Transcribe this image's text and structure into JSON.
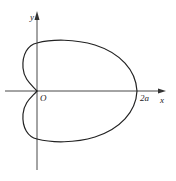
{
  "diagram": {
    "type": "cardioid",
    "equation_hint": "r = a(1 + cos θ)",
    "axes": {
      "x_label": "x",
      "y_label": "y",
      "origin_label": "O",
      "x_tick_label": "2a"
    },
    "colors": {
      "curve": "#222222",
      "axes": "#333333",
      "background": "#ffffff"
    }
  }
}
